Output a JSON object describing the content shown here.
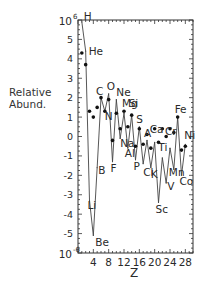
{
  "chart_data": {
    "type": "line",
    "title": "",
    "xlabel": "Z",
    "ylabel": "Relative Abund.",
    "yscale": "log10",
    "xlim": [
      0,
      30
    ],
    "ylim": [
      -6,
      6
    ],
    "x_ticks": [
      4,
      8,
      12,
      16,
      20,
      24,
      28
    ],
    "x_tick_labels": [
      "4",
      "8",
      "12",
      "16",
      "20",
      "24",
      "28"
    ],
    "y_ticks": [
      6,
      5,
      4,
      3,
      2,
      1,
      0,
      -1,
      -2,
      -3,
      -4,
      -5,
      -6
    ],
    "y_tick_labels": [
      "10",
      "5",
      "4",
      "3",
      "2",
      "1",
      "0",
      "-1",
      "-2",
      "-3",
      "-4",
      "-5",
      "10"
    ],
    "y_tick_exponents": {
      "6": "6",
      "-6": "-6"
    },
    "grid": false,
    "legend": "none",
    "series": [
      {
        "name": "solar system (line)",
        "style": "line",
        "x": [
          1,
          2,
          3,
          4,
          5,
          6,
          7,
          8,
          9,
          10,
          11,
          12,
          13,
          14,
          15,
          16,
          17,
          18,
          19,
          20,
          21,
          22,
          23,
          24,
          25,
          26,
          27,
          28
        ],
        "values": [
          5.9,
          4.4,
          -3.3,
          -5.1,
          -1.6,
          2.0,
          1.3,
          2.2,
          -1.3,
          1.9,
          -0.1,
          1.2,
          -0.6,
          1.1,
          -1.2,
          0.5,
          -1.4,
          -0.2,
          -1.6,
          -0.3,
          -3.4,
          -1.1,
          -2.4,
          -0.6,
          -1.7,
          1.0,
          -2.0,
          -0.4
        ]
      },
      {
        "name": "cosmic rays (dots)",
        "style": "scatter",
        "x": [
          1,
          2,
          3,
          4,
          5,
          6,
          7,
          8,
          9,
          10,
          11,
          12,
          13,
          14,
          15,
          16,
          17,
          18,
          19,
          20,
          21,
          22,
          23,
          24,
          25,
          26,
          27,
          28
        ],
        "values": [
          4.3,
          3.7,
          1.3,
          1.0,
          1.5,
          2.0,
          1.3,
          1.9,
          -0.2,
          1.2,
          0.4,
          1.3,
          0.5,
          1.1,
          -0.5,
          0.4,
          -0.4,
          0.1,
          -0.6,
          0.4,
          -0.3,
          0.4,
          0.0,
          0.4,
          0.2,
          1.0,
          -0.7,
          -0.5
        ]
      }
    ],
    "annotations": [
      {
        "text": "H",
        "x": 1,
        "y": 5.9
      },
      {
        "text": "He",
        "x": 2,
        "y": 4.4
      },
      {
        "text": "Li",
        "x": 3,
        "y": -3.3
      },
      {
        "text": "Be",
        "x": 4,
        "y": -5.1
      },
      {
        "text": "B",
        "x": 5,
        "y": -1.6
      },
      {
        "text": "C",
        "x": 6,
        "y": 2.0
      },
      {
        "text": "N",
        "x": 7,
        "y": 1.3
      },
      {
        "text": "O",
        "x": 8,
        "y": 2.2
      },
      {
        "text": "F",
        "x": 9,
        "y": -1.3
      },
      {
        "text": "Ne",
        "x": 10,
        "y": 1.9
      },
      {
        "text": "Na",
        "x": 11,
        "y": -0.1
      },
      {
        "text": "Mg",
        "x": 12,
        "y": 1.2
      },
      {
        "text": "Al",
        "x": 13,
        "y": -0.6
      },
      {
        "text": "Si",
        "x": 14,
        "y": 1.1
      },
      {
        "text": "P",
        "x": 15,
        "y": -1.2
      },
      {
        "text": "S",
        "x": 16,
        "y": 0.5
      },
      {
        "text": "Cl",
        "x": 17,
        "y": -1.4
      },
      {
        "text": "A",
        "x": 18,
        "y": -0.2
      },
      {
        "text": "K",
        "x": 19,
        "y": -1.6
      },
      {
        "text": "Ca",
        "x": 20,
        "y": -0.3
      },
      {
        "text": "Sc",
        "x": 21,
        "y": -3.4
      },
      {
        "text": "Ti",
        "x": 22,
        "y": -1.1
      },
      {
        "text": "V",
        "x": 23,
        "y": -2.4
      },
      {
        "text": "Cr",
        "x": 24,
        "y": -0.6
      },
      {
        "text": "Mn",
        "x": 25,
        "y": -1.7
      },
      {
        "text": "Fe",
        "x": 26,
        "y": 1.0
      },
      {
        "text": "Co",
        "x": 27,
        "y": -2.0
      },
      {
        "text": "Ni",
        "x": 28,
        "y": -0.4
      }
    ]
  },
  "labels": {
    "ylabel_line1": "Relative",
    "ylabel_line2": "Abund."
  }
}
